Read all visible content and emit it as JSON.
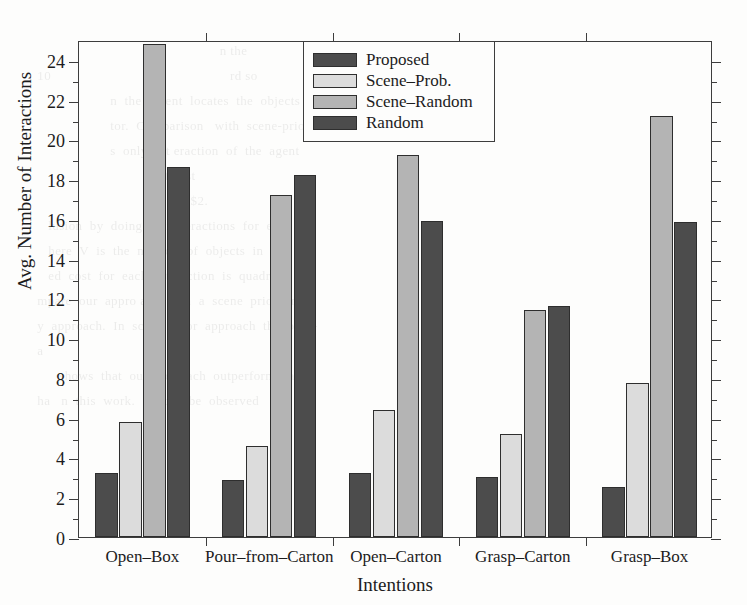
{
  "figure": {
    "background_color": "#fdfdfc",
    "axis_color": "#3d3d3d",
    "scan_bleed_lines": [
      "",
      "                                                    n the",
      "  10                                                 rd so",
      "",
      "                      n  the  ag ent  locates  the  objects",
      "                      tor.  Comparison   with  scene-prior",
      "                      s  only  int eraction  of  the  agent",
      "                                  interest",
      "",
      "                                            $2.",
      "     lusion  by  doing  V  in teractions  for  es-",
      "     here  V  is  the  number  of  objects  in  the",
      "     ed  cost  for  each  interaction  is  quadratic",
      "",
      "  mpare  our  appro ach  with  a  scene  prior  and",
      "  y  approach.  In  scene  prior  approach  the  prob-",
      "  a",
      "",
      "",
      "",
      "",
      "",
      "",
      "",
      "        shows  that  our  approach  outperforms  all",
      "  ha   n  this  work.   It  can  be  observed   that  as"
    ]
  },
  "chart_data": {
    "type": "bar",
    "title": "",
    "xlabel": "Intentions",
    "ylabel": "Avg. Number of Interactions",
    "categories": [
      "Open–Box",
      "Pour–from–Carton",
      "Open–Carton",
      "Grasp–Carton",
      "Grasp–Box"
    ],
    "series": [
      {
        "name": "Proposed",
        "color": "#4c4c4c",
        "values": [
          3.2,
          2.85,
          3.2,
          3.0,
          2.5
        ]
      },
      {
        "name": "Scene–Prob.",
        "color": "#dcdcdc",
        "values": [
          5.8,
          4.6,
          6.4,
          5.2,
          7.75
        ]
      },
      {
        "name": "Scene–Random",
        "color": "#b4b4b4",
        "values": [
          24.8,
          17.2,
          19.2,
          11.4,
          21.2
        ]
      },
      {
        "name": "Random",
        "color": "#4c4c4c",
        "values": [
          18.6,
          18.2,
          15.9,
          11.6,
          15.85
        ]
      }
    ],
    "ylim": [
      0,
      25
    ],
    "y_major_ticks": [
      0,
      2,
      4,
      6,
      8,
      10,
      12,
      14,
      16,
      18,
      20,
      22,
      24
    ],
    "y_minor_ticks": [
      1,
      3,
      5,
      7,
      9,
      11,
      13,
      15,
      17,
      19,
      21,
      23
    ],
    "y_tick_labels": [
      "0",
      "2",
      "4",
      "6",
      "8",
      "10",
      "12",
      "14",
      "16",
      "18",
      "20",
      "22",
      "24"
    ],
    "grid": false,
    "legend": {
      "position": "top-center",
      "entries": [
        "Proposed",
        "Scene–Prob.",
        "Scene–Random",
        "Random"
      ]
    }
  }
}
